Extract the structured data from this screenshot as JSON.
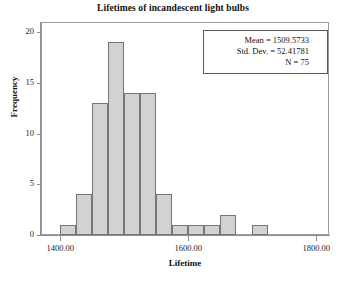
{
  "chart_data": {
    "type": "bar",
    "title": "Lifetimes of incandescent light bulbs",
    "xlabel": "Lifetime",
    "ylabel": "Frequency",
    "xlim": [
      1370,
      1820
    ],
    "ylim": [
      0,
      21
    ],
    "grid": false,
    "legend": "none",
    "bin_width": 25,
    "x_tick_labels": [
      "1400.00",
      "1600.00",
      "1800.00"
    ],
    "x_tick_values": [
      1400,
      1600,
      1800
    ],
    "y_tick_labels": [
      "0",
      "5",
      "10",
      "15",
      "20"
    ],
    "y_tick_values": [
      0,
      5,
      10,
      15,
      20
    ],
    "bin_starts": [
      1400,
      1425,
      1450,
      1475,
      1500,
      1525,
      1550,
      1575,
      1600,
      1625,
      1650,
      1700
    ],
    "bin_centers": [
      1412.5,
      1437.5,
      1462.5,
      1487.5,
      1512.5,
      1537.5,
      1562.5,
      1587.5,
      1612.5,
      1637.5,
      1662.5,
      1712.5
    ],
    "values": [
      1,
      4,
      13,
      19,
      14,
      14,
      4,
      1,
      1,
      1,
      2,
      1
    ],
    "bar_fill_color": "#d2d2d2",
    "bar_border_color": "#777777",
    "axis_color": "#8e8e8e"
  },
  "stats": {
    "mean_line": "Mean = 1509.5733",
    "stddev_line": "Std. Dev. = 52.41781",
    "n_line": "N = 75",
    "mean_value": 1509.5733,
    "stddev_value": 52.41781,
    "n_value": 75
  }
}
